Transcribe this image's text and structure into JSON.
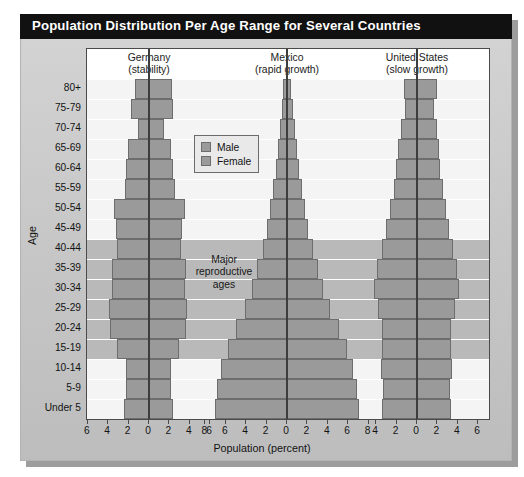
{
  "title": "Population Distribution Per Age Range for Several Countries",
  "axes": {
    "y_title": "Age",
    "x_title": "Population (percent)"
  },
  "legend": {
    "items": [
      {
        "key": "male",
        "label": "Male"
      },
      {
        "key": "female",
        "label": "Female"
      }
    ]
  },
  "annotation": {
    "repro_line1": "Major",
    "repro_line2": "reproductive",
    "repro_line3": "ages"
  },
  "chart_data": {
    "type": "bar",
    "subtype": "population-pyramid",
    "title": "Population Distribution Per Age Range for Several Countries",
    "xlabel": "Population (percent)",
    "ylabel": "Age",
    "grid": true,
    "legend_position": "inside-upper-center",
    "categories": [
      "80+",
      "75-79",
      "70-74",
      "65-69",
      "60-64",
      "55-59",
      "50-54",
      "45-49",
      "40-44",
      "35-39",
      "30-34",
      "25-29",
      "20-24",
      "15-19",
      "10-14",
      "5-9",
      "Under 5"
    ],
    "major_reproductive_ages": [
      "40-44",
      "35-39",
      "30-34",
      "25-29",
      "20-24",
      "15-19"
    ],
    "panels": [
      {
        "name": "Germany",
        "subtitle": "(stability)",
        "xticks": [
          6,
          4,
          2,
          0,
          2,
          4,
          6
        ],
        "xlim": [
          7,
          7
        ],
        "series": [
          {
            "name": "Male",
            "values": [
              1.4,
              1.8,
              1.1,
              2.1,
              2.3,
              2.4,
              3.4,
              3.2,
              3.1,
              3.6,
              3.6,
              3.9,
              3.8,
              3.1,
              2.3,
              2.3,
              2.5
            ]
          },
          {
            "name": "Female",
            "values": [
              2.3,
              2.4,
              1.5,
              2.2,
              2.4,
              2.5,
              3.5,
              3.2,
              3.1,
              3.6,
              3.5,
              3.7,
              3.6,
              2.9,
              2.2,
              2.2,
              2.4
            ]
          }
        ]
      },
      {
        "name": "Mexico",
        "subtitle": "(rapid growth)",
        "xticks": [
          8,
          6,
          4,
          2,
          0,
          2,
          4,
          6,
          8
        ],
        "xlim": [
          9,
          9
        ],
        "series": [
          {
            "name": "Male",
            "values": [
              0.4,
              0.5,
              0.7,
              0.9,
              1.1,
              1.4,
              1.7,
              2.0,
              2.4,
              2.9,
              3.4,
              4.1,
              5.0,
              5.8,
              6.5,
              6.9,
              7.1
            ]
          },
          {
            "name": "Female",
            "values": [
              0.4,
              0.6,
              0.8,
              1.0,
              1.2,
              1.5,
              1.8,
              2.1,
              2.5,
              3.0,
              3.5,
              4.2,
              5.1,
              5.9,
              6.5,
              6.9,
              7.1
            ]
          }
        ]
      },
      {
        "name": "United States",
        "subtitle": "(slow growth)",
        "xticks": [
          4,
          2,
          0,
          2,
          4,
          6
        ],
        "xlim": [
          5,
          7
        ],
        "series": [
          {
            "name": "Male",
            "values": [
              1.3,
              1.2,
              1.6,
              1.9,
              2.1,
              2.3,
              2.6,
              3.0,
              3.4,
              3.9,
              4.2,
              3.8,
              3.4,
              3.4,
              3.5,
              3.3,
              3.4
            ]
          },
          {
            "name": "Female",
            "values": [
              2.0,
              1.7,
              2.0,
              2.2,
              2.3,
              2.5,
              2.8,
              3.1,
              3.5,
              3.9,
              4.1,
              3.7,
              3.3,
              3.3,
              3.4,
              3.2,
              3.3
            ]
          }
        ]
      }
    ]
  }
}
